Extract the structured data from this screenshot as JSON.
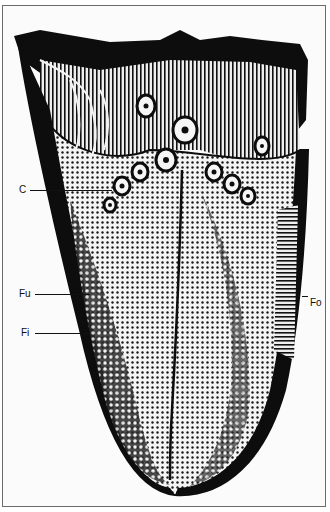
{
  "figure": {
    "labels": [
      {
        "id": "C",
        "text": "C"
      },
      {
        "id": "Fu",
        "text": "Fu"
      },
      {
        "id": "Fi",
        "text": "Fi"
      },
      {
        "id": "Fo",
        "text": "Fo"
      }
    ],
    "colors": {
      "ink": "#0d0d0d",
      "paper": "#fbfbfb",
      "border": "#6a6a6a"
    }
  }
}
